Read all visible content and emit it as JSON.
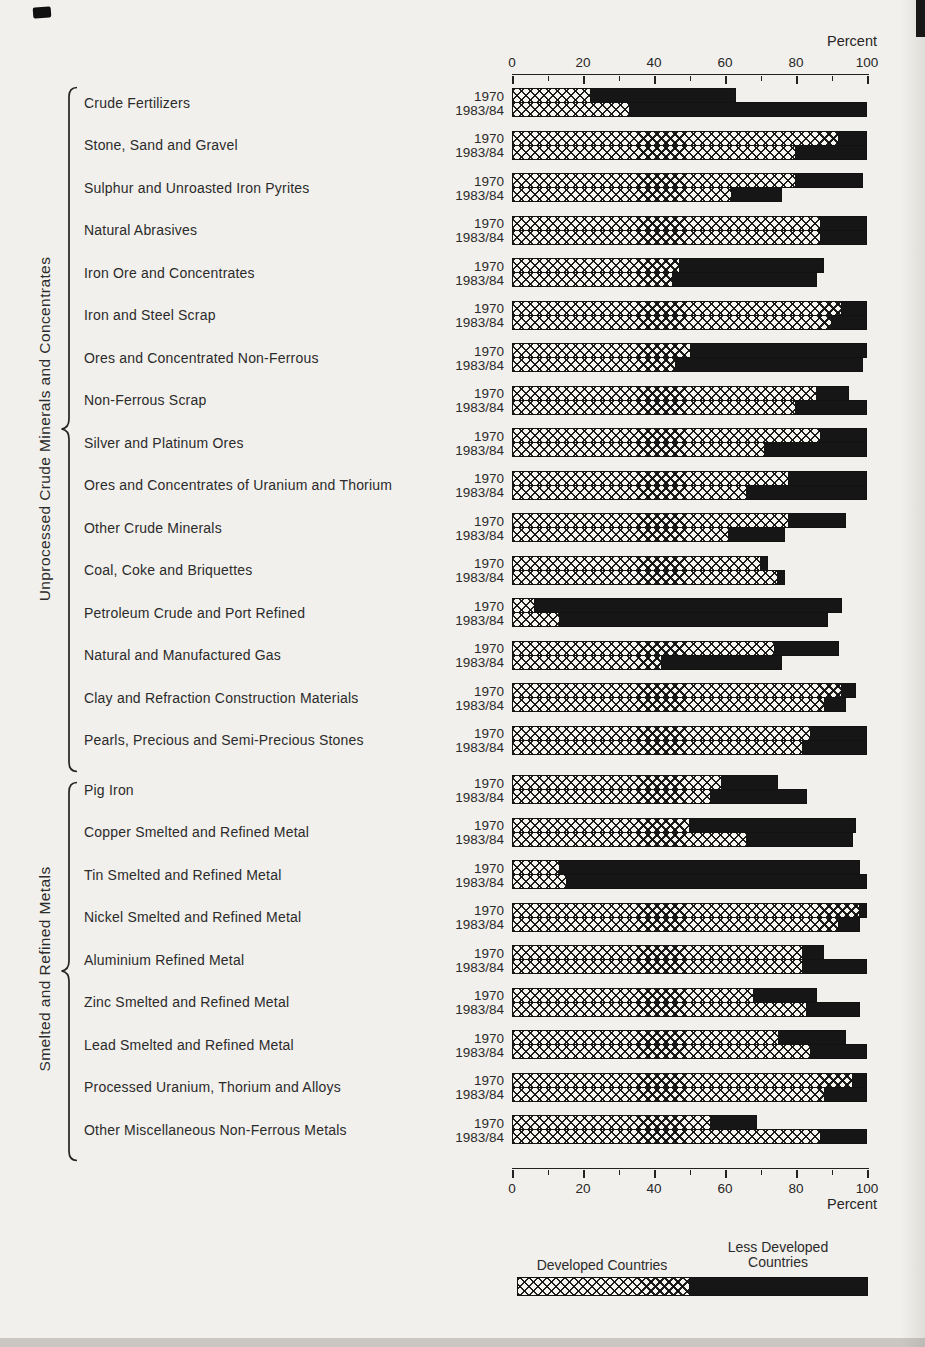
{
  "axis": {
    "label": "Percent",
    "ticks": [
      0,
      20,
      40,
      60,
      80,
      100
    ],
    "minor_step": 10,
    "max": 100
  },
  "legend": {
    "developed_label": "Developed Countries",
    "less_developed_label": "Less Developed\nCountries",
    "developed_share": 49
  },
  "colors": {
    "paper": "#f2f0ec",
    "bar_black": "#161616",
    "hatch_background": "#f7f5f0",
    "text": "#262626"
  },
  "chart_data": {
    "type": "bar",
    "orientation": "horizontal-stacked",
    "unit": "percent",
    "xlim": [
      0,
      100
    ],
    "xlabel": "Percent",
    "series_years": [
      "1970",
      "1983/84"
    ],
    "series_legend": [
      "Developed Countries",
      "Less Developed Countries"
    ],
    "note_values": "developed = crosshatched segment %, total = bar end %; black segment = total - developed",
    "groups": [
      {
        "label": "Unprocessed Crude Minerals and Concentrates",
        "categories": [
          {
            "name": "Crude Fertilizers",
            "bars": [
              {
                "year": "1970",
                "developed": 22,
                "total": 63
              },
              {
                "year": "1983/84",
                "developed": 33,
                "total": 100
              }
            ]
          },
          {
            "name": "Stone, Sand and Gravel",
            "bars": [
              {
                "year": "1970",
                "developed": 92,
                "total": 100
              },
              {
                "year": "1983/84",
                "developed": 80,
                "total": 100
              }
            ]
          },
          {
            "name": "Sulphur and Unroasted Iron Pyrites",
            "bars": [
              {
                "year": "1970",
                "developed": 80,
                "total": 99
              },
              {
                "year": "1983/84",
                "developed": 62,
                "total": 76
              }
            ]
          },
          {
            "name": "Natural Abrasives",
            "bars": [
              {
                "year": "1970",
                "developed": 87,
                "total": 100
              },
              {
                "year": "1983/84",
                "developed": 87,
                "total": 100
              }
            ]
          },
          {
            "name": "Iron Ore and Concentrates",
            "bars": [
              {
                "year": "1970",
                "developed": 47,
                "total": 88
              },
              {
                "year": "1983/84",
                "developed": 45,
                "total": 86
              }
            ]
          },
          {
            "name": "Iron and Steel Scrap",
            "bars": [
              {
                "year": "1970",
                "developed": 93,
                "total": 100
              },
              {
                "year": "1983/84",
                "developed": 90,
                "total": 100
              }
            ]
          },
          {
            "name": "Ores and Concentrated Non-Ferrous",
            "bars": [
              {
                "year": "1970",
                "developed": 50,
                "total": 100
              },
              {
                "year": "1983/84",
                "developed": 46,
                "total": 99
              }
            ]
          },
          {
            "name": "Non-Ferrous Scrap",
            "bars": [
              {
                "year": "1970",
                "developed": 86,
                "total": 95
              },
              {
                "year": "1983/84",
                "developed": 80,
                "total": 100
              }
            ]
          },
          {
            "name": "Silver and Platinum Ores",
            "bars": [
              {
                "year": "1970",
                "developed": 87,
                "total": 100
              },
              {
                "year": "1983/84",
                "developed": 71,
                "total": 100
              }
            ]
          },
          {
            "name": "Ores and Concentrates of Uranium and Thorium",
            "bars": [
              {
                "year": "1970",
                "developed": 78,
                "total": 100
              },
              {
                "year": "1983/84",
                "developed": 66,
                "total": 100
              }
            ]
          },
          {
            "name": "Other Crude Minerals",
            "bars": [
              {
                "year": "1970",
                "developed": 78,
                "total": 94
              },
              {
                "year": "1983/84",
                "developed": 61,
                "total": 77
              }
            ]
          },
          {
            "name": "Coal, Coke and Briquettes",
            "bars": [
              {
                "year": "1970",
                "developed": 70,
                "total": 72
              },
              {
                "year": "1983/84",
                "developed": 75,
                "total": 77
              }
            ]
          },
          {
            "name": "Petroleum Crude and Port Refined",
            "bars": [
              {
                "year": "1970",
                "developed": 6,
                "total": 93
              },
              {
                "year": "1983/84",
                "developed": 13,
                "total": 89
              }
            ]
          },
          {
            "name": "Natural and Manufactured Gas",
            "bars": [
              {
                "year": "1970",
                "developed": 74,
                "total": 92
              },
              {
                "year": "1983/84",
                "developed": 42,
                "total": 76
              }
            ]
          },
          {
            "name": "Clay and Refraction Construction Materials",
            "bars": [
              {
                "year": "1970",
                "developed": 93,
                "total": 97
              },
              {
                "year": "1983/84",
                "developed": 88,
                "total": 94
              }
            ]
          },
          {
            "name": "Pearls, Precious and Semi-Precious Stones",
            "bars": [
              {
                "year": "1970",
                "developed": 84,
                "total": 100
              },
              {
                "year": "1983/84",
                "developed": 82,
                "total": 100
              }
            ]
          }
        ]
      },
      {
        "label": "Smelted and Refined Metals",
        "categories": [
          {
            "name": "Pig Iron",
            "bars": [
              {
                "year": "1970",
                "developed": 59,
                "total": 75
              },
              {
                "year": "1983/84",
                "developed": 56,
                "total": 83
              }
            ]
          },
          {
            "name": "Copper Smelted and Refined Metal",
            "bars": [
              {
                "year": "1970",
                "developed": 50,
                "total": 97
              },
              {
                "year": "1983/84",
                "developed": 66,
                "total": 96
              }
            ]
          },
          {
            "name": "Tin Smelted and Refined Metal",
            "bars": [
              {
                "year": "1970",
                "developed": 13,
                "total": 98
              },
              {
                "year": "1983/84",
                "developed": 15,
                "total": 100
              }
            ]
          },
          {
            "name": "Nickel Smelted and Refined Metal",
            "bars": [
              {
                "year": "1970",
                "developed": 98,
                "total": 100
              },
              {
                "year": "1983/84",
                "developed": 92,
                "total": 98
              }
            ]
          },
          {
            "name": "Aluminium Refined Metal",
            "bars": [
              {
                "year": "1970",
                "developed": 82,
                "total": 88
              },
              {
                "year": "1983/84",
                "developed": 82,
                "total": 100
              }
            ]
          },
          {
            "name": "Zinc Smelted and Refined Metal",
            "bars": [
              {
                "year": "1970",
                "developed": 68,
                "total": 86
              },
              {
                "year": "1983/84",
                "developed": 83,
                "total": 98
              }
            ]
          },
          {
            "name": "Lead Smelted and Refined Metal",
            "bars": [
              {
                "year": "1970",
                "developed": 75,
                "total": 94
              },
              {
                "year": "1983/84",
                "developed": 84,
                "total": 100
              }
            ]
          },
          {
            "name": "Processed Uranium, Thorium and Alloys",
            "bars": [
              {
                "year": "1970",
                "developed": 96,
                "total": 100
              },
              {
                "year": "1983/84",
                "developed": 88,
                "total": 100
              }
            ]
          },
          {
            "name": "Other Miscellaneous Non-Ferrous Metals",
            "bars": [
              {
                "year": "1970",
                "developed": 56,
                "total": 69
              },
              {
                "year": "1983/84",
                "developed": 87,
                "total": 100
              }
            ]
          }
        ]
      }
    ]
  }
}
